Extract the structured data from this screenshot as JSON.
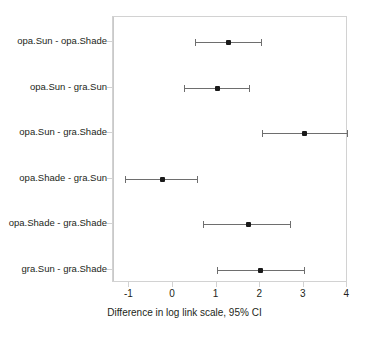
{
  "chart_data": {
    "type": "scatter",
    "title": "",
    "subtitle": "",
    "xlabel": "Difference in log link scale, 95% CI",
    "ylabel": "",
    "xlim": [
      -1.45,
      4.35
    ],
    "ylim": [
      0,
      6
    ],
    "grid": false,
    "legend": null,
    "orientation": "horizontal",
    "plot_style": "forest-plot",
    "reference_line": {
      "value": 0,
      "orientation": "vertical",
      "color": "#c9c9c9"
    },
    "x_ticks": [
      -1,
      0,
      1,
      2,
      3,
      4
    ],
    "x_tick_labels": [
      "-1",
      "0",
      "1",
      "2",
      "3",
      "4"
    ],
    "categories": [
      "opa.Sun - opa.Shade",
      "opa.Sun - gra.Sun",
      "opa.Sun - gra.Shade",
      "opa.Shade - gra.Sun",
      "opa.Shade - gra.Shade",
      "gra.Sun - gra.Shade"
    ],
    "estimates": [
      1.28,
      1.03,
      3.01,
      -0.25,
      1.74,
      2.0
    ],
    "ci_lower": [
      0.5,
      0.25,
      2.03,
      -1.1,
      0.69,
      1.01
    ],
    "ci_upper": [
      2.02,
      1.74,
      3.99,
      0.55,
      2.68,
      3.0
    ],
    "points": [
      {
        "label": "opa.Sun - opa.Shade",
        "estimate": 1.28,
        "lower": 0.5,
        "upper": 2.02
      },
      {
        "label": "opa.Sun - gra.Sun",
        "estimate": 1.03,
        "lower": 0.25,
        "upper": 1.74
      },
      {
        "label": "opa.Sun - gra.Shade",
        "estimate": 3.01,
        "lower": 2.03,
        "upper": 3.99
      },
      {
        "label": "opa.Shade - gra.Sun",
        "estimate": -0.25,
        "lower": -1.1,
        "upper": 0.55
      },
      {
        "label": "opa.Shade - gra.Shade",
        "estimate": 1.74,
        "lower": 0.69,
        "upper": 2.68
      },
      {
        "label": "gra.Sun - gra.Shade",
        "estimate": 2.0,
        "lower": 1.01,
        "upper": 3.0
      }
    ],
    "colors": {
      "point": "#1a1a1a",
      "interval": "#6e6e6e",
      "panel_border": "#d2d2d2",
      "reference_line": "#c9c9c9",
      "text": "#231f20",
      "background": "#ffffff"
    }
  }
}
